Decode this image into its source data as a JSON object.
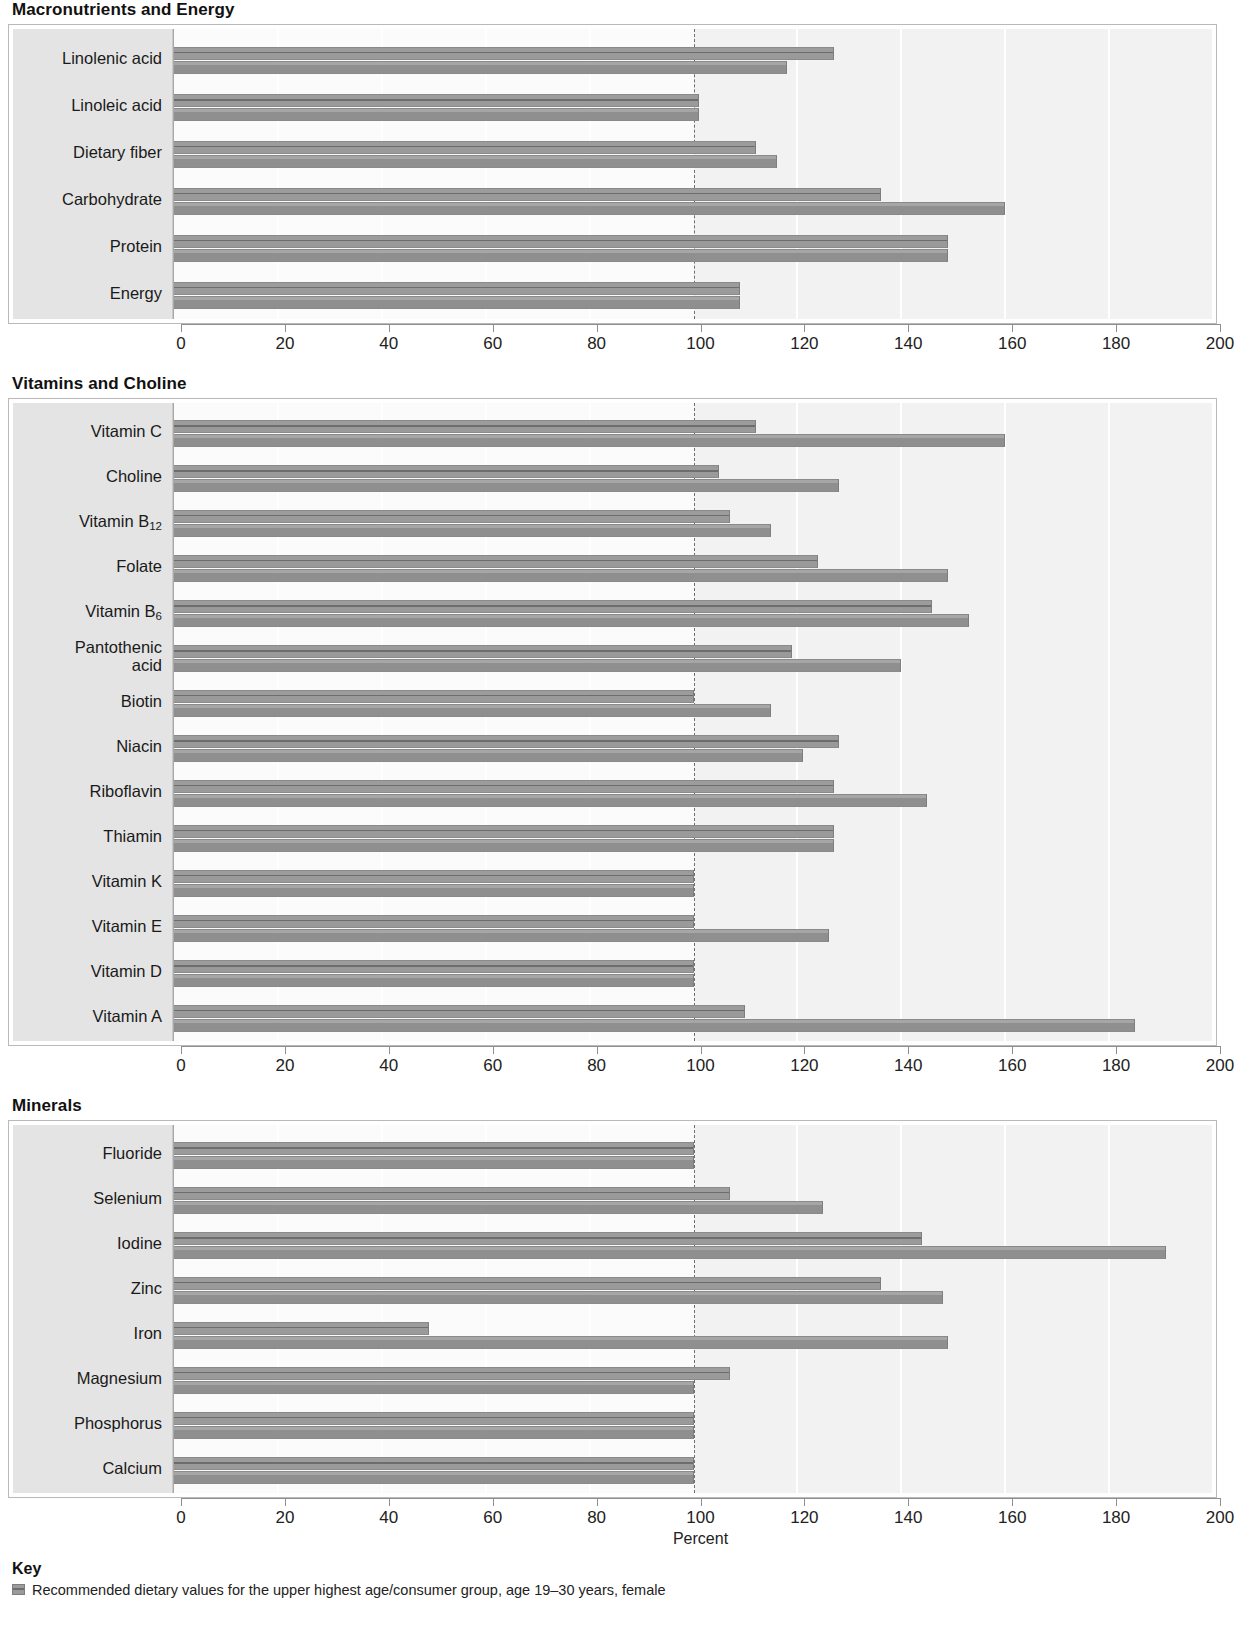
{
  "sections": [
    {
      "title": "Macronutrients and Energy",
      "rows": [
        {
          "label": "Linolenic acid",
          "values": [
            127,
            118
          ]
        },
        {
          "label": "Linoleic acid",
          "values": [
            101,
            101
          ]
        },
        {
          "label": "Dietary fiber",
          "values": [
            112,
            116
          ]
        },
        {
          "label": "Carbohydrate",
          "values": [
            136,
            160
          ]
        },
        {
          "label": "Protein",
          "values": [
            149,
            149
          ]
        },
        {
          "label": "Energy",
          "values": [
            109,
            109
          ]
        }
      ]
    },
    {
      "title": "Vitamins and Choline",
      "rows": [
        {
          "label": "Vitamin C",
          "values": [
            112,
            160
          ]
        },
        {
          "label": "Choline",
          "values": [
            105,
            128
          ]
        },
        {
          "label": "Vitamin B12",
          "label_base": "Vitamin B",
          "label_sub": "12",
          "values": [
            107,
            115
          ]
        },
        {
          "label": "Folate",
          "values": [
            124,
            149
          ]
        },
        {
          "label": "Vitamin B6",
          "label_base": "Vitamin B",
          "label_sub": "6",
          "values": [
            146,
            153
          ]
        },
        {
          "label": "Pantothenic acid",
          "label_two_line": "Pantothenic\nacid",
          "values": [
            119,
            140
          ]
        },
        {
          "label": "Biotin",
          "values": [
            100,
            115
          ]
        },
        {
          "label": "Niacin",
          "values": [
            128,
            121
          ]
        },
        {
          "label": "Riboflavin",
          "values": [
            127,
            145
          ]
        },
        {
          "label": "Thiamin",
          "values": [
            127,
            127
          ]
        },
        {
          "label": "Vitamin K",
          "values": [
            100,
            100
          ]
        },
        {
          "label": "Vitamin E",
          "values": [
            100,
            126
          ]
        },
        {
          "label": "Vitamin D",
          "values": [
            100,
            100
          ]
        },
        {
          "label": "Vitamin A",
          "values": [
            110,
            185
          ]
        }
      ]
    },
    {
      "title": "Minerals",
      "rows": [
        {
          "label": "Fluoride",
          "values": [
            100,
            100
          ]
        },
        {
          "label": "Selenium",
          "values": [
            107,
            125
          ]
        },
        {
          "label": "Iodine",
          "values": [
            144,
            191
          ]
        },
        {
          "label": "Zinc",
          "values": [
            136,
            148
          ]
        },
        {
          "label": "Iron",
          "values": [
            49,
            149
          ]
        },
        {
          "label": "Magnesium",
          "values": [
            107,
            100
          ]
        },
        {
          "label": "Phosphorus",
          "values": [
            100,
            100
          ]
        },
        {
          "label": "Calcium",
          "values": [
            100,
            100
          ]
        }
      ]
    }
  ],
  "axis": {
    "ticks": [
      "0",
      "20",
      "40",
      "60",
      "80",
      "100",
      "120",
      "140",
      "160",
      "180",
      "200"
    ],
    "title": "Percent",
    "min": 0,
    "max": 200,
    "reference": 100
  },
  "key": {
    "heading": "Key",
    "entries": [
      {
        "text": "Recommended dietary values for the upper highest age/consumer group, age 19–30 years, female"
      }
    ]
  },
  "chart_data": {
    "type": "bar",
    "orientation": "horizontal",
    "xlabel": "Percent",
    "ylabel": "",
    "xlim": [
      0,
      200
    ],
    "xticks": [
      0,
      20,
      40,
      60,
      80,
      100,
      120,
      140,
      160,
      180,
      200
    ],
    "reference_line": 100,
    "grid": true,
    "legend_position": "bottom",
    "series": [
      {
        "name": "Series 1 (upper bar)"
      },
      {
        "name": "Series 2 (lower bar)"
      }
    ],
    "panels": [
      {
        "title": "Macronutrients and Energy",
        "categories": [
          "Linolenic acid",
          "Linoleic acid",
          "Dietary fiber",
          "Carbohydrate",
          "Protein",
          "Energy"
        ],
        "series": [
          {
            "name": "Series 1 (upper bar)",
            "values": [
              127,
              101,
              112,
              136,
              149,
              109
            ]
          },
          {
            "name": "Series 2 (lower bar)",
            "values": [
              118,
              101,
              116,
              160,
              149,
              109
            ]
          }
        ]
      },
      {
        "title": "Vitamins and Choline",
        "categories": [
          "Vitamin C",
          "Choline",
          "Vitamin B12",
          "Folate",
          "Vitamin B6",
          "Pantothenic acid",
          "Biotin",
          "Niacin",
          "Riboflavin",
          "Thiamin",
          "Vitamin K",
          "Vitamin E",
          "Vitamin D",
          "Vitamin A"
        ],
        "series": [
          {
            "name": "Series 1 (upper bar)",
            "values": [
              112,
              105,
              107,
              124,
              146,
              119,
              100,
              128,
              127,
              127,
              100,
              100,
              100,
              110
            ]
          },
          {
            "name": "Series 2 (lower bar)",
            "values": [
              160,
              128,
              115,
              149,
              153,
              140,
              115,
              121,
              145,
              127,
              100,
              126,
              100,
              185
            ]
          }
        ]
      },
      {
        "title": "Minerals",
        "categories": [
          "Fluoride",
          "Selenium",
          "Iodine",
          "Zinc",
          "Iron",
          "Magnesium",
          "Phosphorus",
          "Calcium"
        ],
        "series": [
          {
            "name": "Series 1 (upper bar)",
            "values": [
              100,
              107,
              144,
              136,
              49,
              107,
              100,
              100
            ]
          },
          {
            "name": "Series 2 (lower bar)",
            "values": [
              100,
              125,
              191,
              148,
              149,
              100,
              100,
              100
            ]
          }
        ]
      }
    ]
  }
}
